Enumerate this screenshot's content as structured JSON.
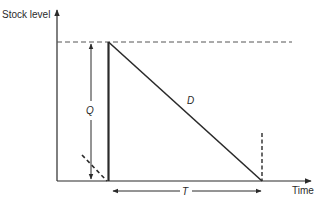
{
  "diagram": {
    "y_axis_label": "Stock level",
    "x_axis_label": "Time",
    "order_quantity_label": "Q",
    "demand_label": "D",
    "cycle_time_label": "T",
    "colors": {
      "line": "#2a2a2a",
      "dashed": "#555555",
      "background": "#ffffff"
    }
  }
}
